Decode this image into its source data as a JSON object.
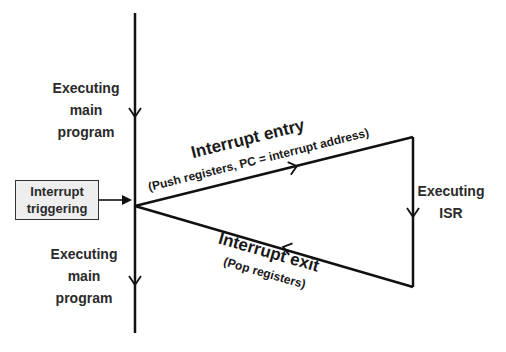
{
  "diagram": {
    "main_timeline": {
      "top_label": [
        "Executing",
        "main",
        "program"
      ],
      "bottom_label": [
        "Executing",
        "main",
        "program"
      ]
    },
    "trigger_box": {
      "lines": [
        "Interrupt",
        "triggering"
      ],
      "fill": "#eeeeee"
    },
    "entry": {
      "title": "Interrupt entry",
      "subtitle": "(Push registers, PC = interrupt address)"
    },
    "isr": {
      "label": [
        "Executing",
        "ISR"
      ]
    },
    "exit": {
      "title": "Interrupt exit",
      "subtitle": "(Pop registers)"
    },
    "colors": {
      "line": "#111111",
      "text": "#2a2a2a"
    }
  }
}
